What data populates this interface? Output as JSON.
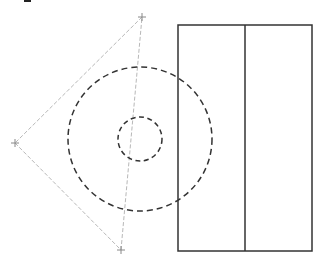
{
  "canvas": {
    "width": 322,
    "height": 266,
    "background": "#ffffff"
  },
  "colors": {
    "construction_line": "#b8b8b8",
    "marker": "#888888",
    "circle": "#333333",
    "rectangle": "#333333",
    "corner_mark": "#222222"
  },
  "triangle": {
    "points": [
      {
        "name": "top",
        "x": 142,
        "y": 17
      },
      {
        "name": "left",
        "x": 15,
        "y": 143
      },
      {
        "name": "bottom",
        "x": 121,
        "y": 250
      }
    ],
    "style": "dashed-light"
  },
  "circles": [
    {
      "name": "outer",
      "cx": 140,
      "cy": 139,
      "r": 72,
      "style": "dashed"
    },
    {
      "name": "inner",
      "cx": 140,
      "cy": 139,
      "r": 22,
      "style": "dashed"
    }
  ],
  "rectangle": {
    "x": 178,
    "y": 25,
    "width": 134,
    "height": 226,
    "divider_x": 245
  },
  "corner_mark": {
    "x": 24,
    "y": 0,
    "width": 7,
    "height": 2
  }
}
